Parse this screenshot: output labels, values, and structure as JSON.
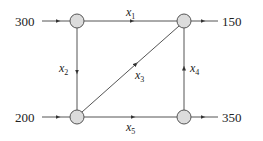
{
  "diagram": {
    "type": "network-flow",
    "colors": {
      "node_fill": "#dcdcdc",
      "stroke": "#555555",
      "text": "#222222"
    },
    "nodes": [
      {
        "id": "A",
        "position": "top-left"
      },
      {
        "id": "B",
        "position": "top-right"
      },
      {
        "id": "C",
        "position": "bottom-left"
      },
      {
        "id": "D",
        "position": "bottom-right"
      }
    ],
    "external_flows": [
      {
        "node": "A",
        "direction": "in",
        "value": "300"
      },
      {
        "node": "B",
        "direction": "out",
        "value": "150"
      },
      {
        "node": "C",
        "direction": "in",
        "value": "200"
      },
      {
        "node": "D",
        "direction": "out",
        "value": "350"
      }
    ],
    "edges": [
      {
        "var": "x",
        "sub": "1",
        "from": "A",
        "to": "B"
      },
      {
        "var": "x",
        "sub": "2",
        "from": "A",
        "to": "C"
      },
      {
        "var": "x",
        "sub": "3",
        "from": "C",
        "to": "B"
      },
      {
        "var": "x",
        "sub": "4",
        "from": "D",
        "to": "B"
      },
      {
        "var": "x",
        "sub": "5",
        "from": "C",
        "to": "D"
      }
    ]
  }
}
